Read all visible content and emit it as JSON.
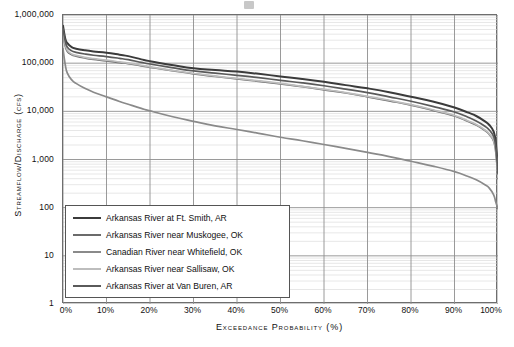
{
  "axes": {
    "y_title": "Streamflow/Discharge (cfs)",
    "x_title": "Exceedance Probability (%)",
    "y_ticks": [
      "1,000,000",
      "100,000",
      "10,000",
      "1,000",
      "100",
      "10",
      "1"
    ],
    "x_ticks": [
      "0%",
      "10%",
      "20%",
      "30%",
      "40%",
      "50%",
      "60%",
      "70%",
      "80%",
      "90%",
      "100%"
    ]
  },
  "legend": {
    "items": [
      {
        "label": "Arkansas River at Ft. Smith, AR",
        "color": "#3b3b3b"
      },
      {
        "label": "Arkansas River near Muskogee, OK",
        "color": "#6b6b6b"
      },
      {
        "label": "Canadian River near Whitefield, OK",
        "color": "#8a8a8a"
      },
      {
        "label": "Arkansas River near Sallisaw, OK",
        "color": "#bdbdbd"
      },
      {
        "label": "Arkansas River at Van Buren, AR",
        "color": "#5a5a5a"
      }
    ]
  },
  "chart_data": {
    "type": "line",
    "title": "",
    "xlabel": "Exceedance Probability (%)",
    "ylabel": "Streamflow/Discharge (cfs)",
    "x_scale": "linear",
    "y_scale": "log",
    "xlim": [
      0,
      100
    ],
    "ylim": [
      1,
      1000000
    ],
    "grid": true,
    "legend_position": "lower-left-inside",
    "x": [
      0,
      0.5,
      1,
      2,
      3,
      5,
      7,
      10,
      13,
      15,
      18,
      20,
      25,
      30,
      35,
      40,
      45,
      50,
      55,
      60,
      65,
      70,
      75,
      80,
      85,
      90,
      93,
      95,
      97,
      98,
      99,
      99.5,
      100
    ],
    "series": [
      {
        "name": "Arkansas River at Ft. Smith, AR",
        "color": "#3b3b3b",
        "values": [
          600000,
          330000,
          260000,
          215000,
          200000,
          185000,
          175000,
          165000,
          150000,
          140000,
          120000,
          110000,
          92000,
          78000,
          72000,
          67000,
          60000,
          53000,
          47000,
          41000,
          35000,
          30000,
          25000,
          20000,
          16000,
          12000,
          9500,
          8000,
          6200,
          5200,
          3800,
          2200,
          600
        ]
      },
      {
        "name": "Arkansas River near Muskogee, OK",
        "color": "#6b6b6b",
        "values": [
          420000,
          230000,
          175000,
          150000,
          140000,
          128000,
          120000,
          112000,
          103000,
          98000,
          88000,
          82000,
          70000,
          60000,
          53000,
          47000,
          42000,
          37000,
          32500,
          28000,
          24000,
          20000,
          16500,
          13500,
          10500,
          8000,
          6200,
          5200,
          4000,
          3300,
          2400,
          1400,
          400
        ]
      },
      {
        "name": "Canadian River near Whitefield, OK",
        "color": "#8a8a8a",
        "values": [
          200000,
          95000,
          62000,
          45000,
          38000,
          30000,
          25000,
          20000,
          16000,
          14000,
          11500,
          10200,
          7800,
          6200,
          5000,
          4200,
          3500,
          2900,
          2450,
          2050,
          1700,
          1400,
          1150,
          920,
          730,
          560,
          450,
          380,
          300,
          255,
          185,
          130,
          95
        ]
      },
      {
        "name": "Arkansas River near Sallisaw, OK",
        "color": "#bdbdbd",
        "values": [
          450000,
          250000,
          185000,
          155000,
          145000,
          132000,
          124000,
          116000,
          106000,
          100000,
          90000,
          84000,
          71000,
          61000,
          54000,
          48000,
          43000,
          38000,
          33000,
          28500,
          24500,
          20500,
          17000,
          13800,
          10800,
          8200,
          6400,
          5300,
          4100,
          3400,
          2500,
          1450,
          420
        ]
      },
      {
        "name": "Arkansas River at Van Buren, AR",
        "color": "#5a5a5a",
        "values": [
          520000,
          290000,
          215000,
          180000,
          168000,
          155000,
          146000,
          137000,
          126000,
          118000,
          104000,
          96000,
          81000,
          69000,
          62000,
          56000,
          50000,
          44000,
          39000,
          34000,
          29000,
          24500,
          20000,
          16200,
          12700,
          9700,
          7600,
          6300,
          4900,
          4100,
          3000,
          1750,
          500
        ]
      }
    ]
  }
}
